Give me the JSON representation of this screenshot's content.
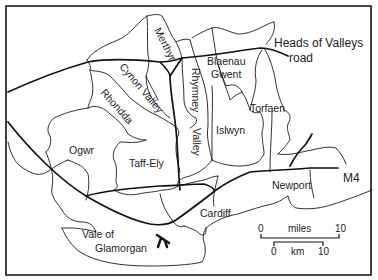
{
  "map": {
    "districts": [
      {
        "id": "merthyr",
        "label": "Merthyr"
      },
      {
        "id": "cynon-valley",
        "label": "Cynon Valley"
      },
      {
        "id": "rhondda",
        "label": "Rhondda"
      },
      {
        "id": "rhymney-valley-1",
        "label": "Rhymney"
      },
      {
        "id": "rhymney-valley-2",
        "label": "Valley"
      },
      {
        "id": "blaenau-gwent-1",
        "label": "Blaenau"
      },
      {
        "id": "blaenau-gwent-2",
        "label": "Gwent"
      },
      {
        "id": "torfaen",
        "label": "Torfaen"
      },
      {
        "id": "islwyn",
        "label": "Islwyn"
      },
      {
        "id": "ogwr",
        "label": "Ogwr"
      },
      {
        "id": "taff-ely",
        "label": "Taff-Ely"
      },
      {
        "id": "newport",
        "label": "Newport"
      },
      {
        "id": "cardiff",
        "label": "Cardiff"
      },
      {
        "id": "vale-1",
        "label": "Vale of"
      },
      {
        "id": "vale-2",
        "label": "Glamorgan"
      }
    ],
    "roads": [
      {
        "id": "heads-of-valleys-1",
        "label": "Heads of Valleys"
      },
      {
        "id": "heads-of-valleys-2",
        "label": "road"
      },
      {
        "id": "m4",
        "label": "M4"
      }
    ],
    "airport_icon": "airplane-icon",
    "scale": {
      "miles_start": "0",
      "miles_label": "miles",
      "miles_end": "10",
      "km_start": "0",
      "km_label": "km",
      "km_end": "10"
    }
  }
}
